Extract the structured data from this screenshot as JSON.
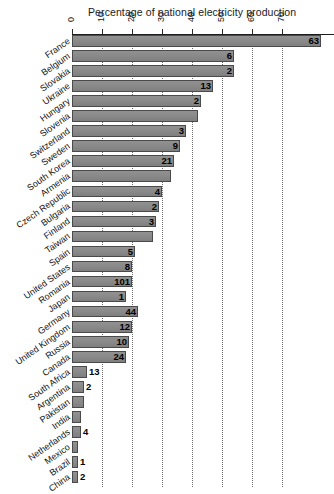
{
  "chart_data": {
    "type": "bar",
    "orientation": "horizontal",
    "title": "Percentage of national electricity production",
    "xlabel": "Percentage of national electricity production",
    "ylabel": "",
    "xlim": [
      0,
      83
    ],
    "xticks": [
      0,
      10,
      20,
      30,
      40,
      50,
      60,
      70
    ],
    "xtick_labels": [
      "0",
      "10",
      "20",
      "30",
      "40",
      "50",
      "60",
      "70"
    ],
    "grid": "vertical-dotted",
    "legend": null,
    "bar_color": "#8a8a8a",
    "bar_edge_color": "#4a4a4a",
    "categories": [
      "France",
      "Belgium",
      "Slovakia",
      "Ukraine",
      "Hungary",
      "Slovenia",
      "Switzerland",
      "Sweden",
      "South Korea",
      "Armenia",
      "Czech Republic",
      "Bulgaria",
      "Finland",
      "Taiwan",
      "Spain",
      "United States",
      "Romania",
      "Japan",
      "Germany",
      "United Kingdom",
      "Russia",
      "Canada",
      "South Africa",
      "Argentina",
      "Pakistan",
      "India",
      "Netherlands",
      "Mexico",
      "Brazil",
      "China"
    ],
    "values": [
      83,
      54,
      54,
      47,
      43,
      42,
      38,
      36,
      34,
      33,
      30,
      29,
      28,
      27,
      21,
      20,
      20,
      18,
      22,
      20,
      19,
      18,
      5,
      4,
      4,
      3,
      3,
      2,
      2,
      2
    ],
    "labels": [
      "63",
      "6",
      "2",
      "13",
      "2",
      "",
      "3",
      "9",
      "21",
      "",
      "4",
      "2",
      "3",
      "",
      "5",
      "8",
      "101",
      "1",
      "44",
      "12",
      "10",
      "24",
      "13",
      "2",
      "",
      "",
      "4",
      "",
      "1",
      "2"
    ],
    "china_label": "12"
  }
}
